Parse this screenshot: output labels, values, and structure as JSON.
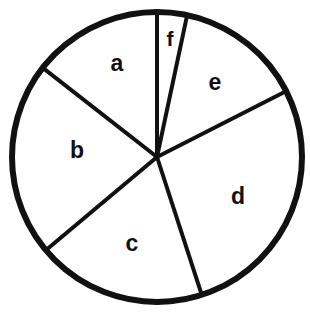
{
  "figure": {
    "name": "pie-chart-sectors",
    "background_color": "#ffffff",
    "stroke_color": "#111111",
    "fill_color": "#ffffff",
    "circle": {
      "center_x": 157,
      "center_y": 157,
      "radius": 145,
      "outline_width": 6
    },
    "divider_width": 4
  },
  "chart_data": {
    "type": "pie",
    "title": "",
    "xlabel": "",
    "ylabel": "",
    "legend": "none",
    "grid": false,
    "units": "degrees",
    "start_angle_deg": 0,
    "direction": "clockwise",
    "categories": [
      "f",
      "e",
      "d",
      "c",
      "b",
      "a"
    ],
    "values": [
      12,
      51,
      99,
      68,
      78,
      52
    ],
    "labels": [
      "f",
      "e",
      "d",
      "c",
      "b",
      "a"
    ],
    "slices": [
      {
        "label": "f",
        "start_deg": 0,
        "end_deg": 12,
        "sweep_deg": 12,
        "percent": 3.3,
        "label_x": 170,
        "label_y": 38
      },
      {
        "label": "e",
        "start_deg": 12,
        "end_deg": 63,
        "sweep_deg": 51,
        "percent": 14.2,
        "label_x": 215,
        "label_y": 82
      },
      {
        "label": "d",
        "start_deg": 63,
        "end_deg": 162,
        "sweep_deg": 99,
        "percent": 27.5,
        "label_x": 238,
        "label_y": 196
      },
      {
        "label": "c",
        "start_deg": 162,
        "end_deg": 230,
        "sweep_deg": 68,
        "percent": 18.9,
        "label_x": 132,
        "label_y": 243
      },
      {
        "label": "b",
        "start_deg": 230,
        "end_deg": 308,
        "sweep_deg": 78,
        "percent": 21.7,
        "label_x": 77,
        "label_y": 150
      },
      {
        "label": "a",
        "start_deg": 308,
        "end_deg": 360,
        "sweep_deg": 52,
        "percent": 14.4,
        "label_x": 117,
        "label_y": 63
      }
    ]
  }
}
